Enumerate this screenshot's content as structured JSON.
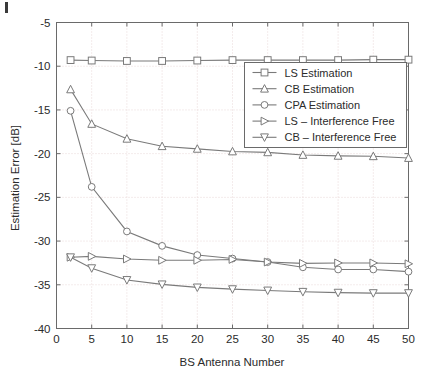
{
  "figure": {
    "background_color": "#ffffff",
    "frame_color": "#6a6a6a",
    "grid_color": "#e8d8d8",
    "series_color": "#7a7a7a",
    "text_color": "#2b2b2b"
  },
  "chart_data": {
    "type": "line",
    "title": "",
    "xlabel": "BS Antenna Number",
    "ylabel": "Estimation Error [dB]",
    "xlim": [
      0,
      50
    ],
    "ylim": [
      -40,
      -5
    ],
    "xticks": [
      0,
      5,
      10,
      15,
      20,
      25,
      30,
      35,
      40,
      45,
      50
    ],
    "xtick_labels": [
      "0",
      "5",
      "10",
      "15",
      "20",
      "25",
      "30",
      "35",
      "40",
      "45",
      "50"
    ],
    "yticks": [
      -40,
      -35,
      -30,
      -25,
      -20,
      -15,
      -10,
      -5
    ],
    "ytick_labels": [
      "-40",
      "-35",
      "-30",
      "-25",
      "-20",
      "-15",
      "-10",
      "-5"
    ],
    "grid": true,
    "grid_style": "dotted",
    "legend_position": "upper right",
    "x": [
      2,
      5,
      10,
      15,
      20,
      25,
      30,
      35,
      40,
      45,
      50
    ],
    "series": [
      {
        "name": "LS Estimation",
        "marker": "square",
        "values": [
          -9.3,
          -9.35,
          -9.4,
          -9.4,
          -9.35,
          -9.3,
          -9.3,
          -9.3,
          -9.3,
          -9.25,
          -9.25
        ]
      },
      {
        "name": "CB Estimation",
        "marker": "triangle-up",
        "values": [
          -12.65,
          -16.6,
          -18.3,
          -19.15,
          -19.45,
          -19.75,
          -19.85,
          -20.15,
          -20.25,
          -20.3,
          -20.5
        ]
      },
      {
        "name": "CPA Estimation",
        "marker": "circle",
        "values": [
          -15.1,
          -23.8,
          -28.9,
          -30.55,
          -31.6,
          -32.0,
          -32.4,
          -33.0,
          -33.25,
          -33.25,
          -33.5
        ]
      },
      {
        "name": "LS – Interference Free",
        "marker": "triangle-right",
        "values": [
          -31.85,
          -31.75,
          -32.05,
          -32.2,
          -32.2,
          -32.1,
          -32.4,
          -32.55,
          -32.5,
          -32.5,
          -32.6
        ]
      },
      {
        "name": "CB – Interference Free",
        "marker": "triangle-down",
        "values": [
          -31.85,
          -33.1,
          -34.45,
          -34.95,
          -35.3,
          -35.5,
          -35.65,
          -35.8,
          -35.9,
          -35.95,
          -35.95
        ]
      }
    ]
  },
  "legend": {
    "entries": [
      {
        "label": "LS Estimation",
        "marker": "square"
      },
      {
        "label": "CB Estimation",
        "marker": "triangle-up"
      },
      {
        "label": "CPA Estimation",
        "marker": "circle"
      },
      {
        "label": "LS – Interference Free",
        "marker": "triangle-right"
      },
      {
        "label": "CB – Interference Free",
        "marker": "triangle-down"
      }
    ]
  }
}
